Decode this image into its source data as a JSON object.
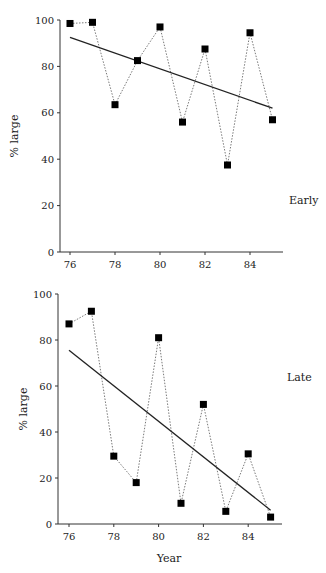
{
  "chart_data": [
    {
      "type": "line",
      "panel_label": "Early",
      "xlabel": "",
      "ylabel": "% large",
      "ylim": [
        0,
        100
      ],
      "xlim": [
        75.5,
        86.5
      ],
      "yticks": [
        0,
        20,
        40,
        60,
        80,
        100
      ],
      "xticks": [
        76,
        78,
        80,
        82,
        84
      ],
      "grid": false,
      "x": [
        76,
        77,
        78,
        79,
        80,
        81,
        82,
        83,
        84,
        85
      ],
      "series": [
        {
          "name": "observed",
          "style": "dotted line with square markers",
          "values": [
            98.5,
            99,
            63.5,
            82.5,
            97,
            56,
            87.5,
            37.5,
            94.5,
            57
          ]
        },
        {
          "name": "trend",
          "style": "solid regression line",
          "x": [
            76,
            85
          ],
          "values": [
            92.5,
            62
          ]
        }
      ]
    },
    {
      "type": "line",
      "panel_label": "Late",
      "xlabel": "Year",
      "ylabel": "% large",
      "ylim": [
        0,
        100
      ],
      "xlim": [
        75.5,
        86.5
      ],
      "yticks": [
        0,
        20,
        40,
        60,
        80,
        100
      ],
      "xticks": [
        76,
        78,
        80,
        82,
        84
      ],
      "grid": false,
      "x": [
        76,
        77,
        78,
        79,
        80,
        81,
        82,
        83,
        84,
        85
      ],
      "series": [
        {
          "name": "observed",
          "style": "dotted line with square markers",
          "values": [
            87,
            92.5,
            29.5,
            18,
            81,
            9,
            52,
            5.5,
            30.5,
            3
          ]
        },
        {
          "name": "trend",
          "style": "solid regression line",
          "x": [
            76,
            85
          ],
          "values": [
            75.5,
            6
          ]
        }
      ]
    }
  ],
  "layout": {
    "panels": [
      {
        "x0": 70,
        "xstep": 22.5,
        "yTop": 20,
        "yBottom": 252,
        "axisLeft": 60,
        "axisRight": 283,
        "labelX": 289,
        "labelY": 204,
        "ylabelX": 18,
        "ylabelY": 136
      },
      {
        "x0": 69,
        "xstep": 22.4,
        "yTop": 294,
        "yBottom": 524,
        "axisLeft": 58,
        "axisRight": 282,
        "labelX": 287,
        "labelY": 381,
        "ylabelX": 27,
        "ylabelY": 409,
        "xlabelX": 169,
        "xlabelY": 562
      }
    ],
    "colors": {
      "axis": "#333333",
      "marker": "#000000",
      "dotted": "#7a7a7a",
      "trend": "#222222"
    }
  }
}
